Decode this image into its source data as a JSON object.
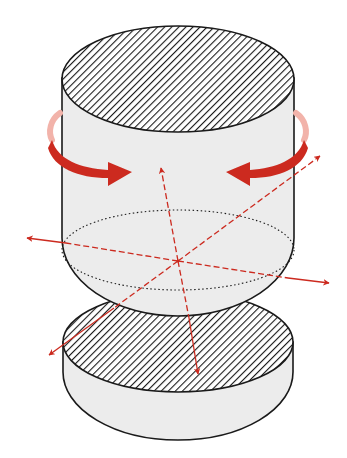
{
  "diagram": {
    "colors": {
      "background": "#ffffff",
      "body_fill": "#ececec",
      "outline": "#1a1a1a",
      "hatch": "#1a1a1a",
      "accent_red": "#cc2a1f",
      "accent_red_light": "#f2b3aa"
    },
    "parts": [
      {
        "name": "upper-cylinder",
        "cap": "hatched top face",
        "section": "dotted cut-plane ellipse"
      },
      {
        "name": "lower-disc",
        "cap": "hatched top face"
      }
    ],
    "arrows": [
      {
        "name": "rotation-arrow-left",
        "type": "curved",
        "direction": "clockwise toward center"
      },
      {
        "name": "rotation-arrow-right",
        "type": "curved",
        "direction": "counter-clockwise toward center"
      },
      {
        "name": "axis-left",
        "type": "dashed-to-solid",
        "direction": "left"
      },
      {
        "name": "axis-right",
        "type": "dashed-to-solid",
        "direction": "right"
      },
      {
        "name": "axis-up",
        "type": "dashed",
        "direction": "up"
      },
      {
        "name": "axis-down",
        "type": "dashed-to-solid",
        "direction": "down"
      },
      {
        "name": "axis-upper-right",
        "type": "dashed",
        "direction": "upper-right"
      },
      {
        "name": "axis-lower-left",
        "type": "dashed-to-solid",
        "direction": "lower-left"
      }
    ]
  }
}
